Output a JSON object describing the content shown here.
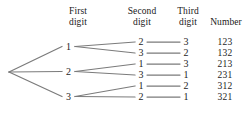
{
  "diagram": {
    "type": "tree-diagram",
    "title": "",
    "line_color": "#7b7b7b",
    "text_color": "#1d1d1d",
    "background": "#ffffff",
    "headers": [
      {
        "id": "first-digit",
        "line1": "First",
        "line2": "digit"
      },
      {
        "id": "second-digit",
        "line1": "Second",
        "line2": "digit"
      },
      {
        "id": "third-digit",
        "line1": "Third",
        "line2": "digit"
      },
      {
        "id": "number",
        "line1": "",
        "line2": "Number"
      }
    ],
    "first_digits": [
      "1",
      "2",
      "3"
    ],
    "rows": [
      {
        "first": "1",
        "second": "2",
        "third": "3",
        "number": "123"
      },
      {
        "first": "1",
        "second": "3",
        "third": "2",
        "number": "132"
      },
      {
        "first": "2",
        "second": "1",
        "third": "3",
        "number": "213"
      },
      {
        "first": "2",
        "second": "3",
        "third": "1",
        "number": "231"
      },
      {
        "first": "3",
        "second": "1",
        "third": "2",
        "number": "312"
      },
      {
        "first": "3",
        "second": "2",
        "third": "1",
        "number": "321"
      }
    ]
  }
}
